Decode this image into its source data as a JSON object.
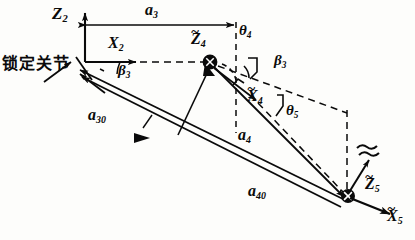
{
  "figure": {
    "type": "kinematic-linkage-diagram",
    "caption_text": "锁定关节",
    "background_color": "#fdfdfb",
    "ink_color": "#0a0a0a"
  },
  "annotations": {
    "locked_joint_label": "锁定关节",
    "z2": "Z",
    "z2_sub": "2",
    "x2": "X",
    "x2_sub": "2",
    "a3": "a",
    "a3_sub": "3",
    "z4t": "Z",
    "z4t_sub": "4",
    "theta4": "θ",
    "theta4_sub": "4",
    "beta3_left": "β",
    "beta3_left_sub": "3",
    "beta3_right": "β",
    "beta3_right_sub": "3",
    "x4t": "X",
    "x4t_sub": "4",
    "theta5": "θ",
    "theta5_sub": "5",
    "a30": "a",
    "a30_sub": "30",
    "a4": "a",
    "a4_sub": "4",
    "a40": "a",
    "a40_sub": "40",
    "z5t": "Z",
    "z5t_sub": "5",
    "x5t": "X",
    "x5t_sub": "5",
    "tilde_mark": "~"
  },
  "geometry": {
    "origin": {
      "x": 85,
      "y": 62
    },
    "joint4": {
      "x": 210,
      "y": 62
    },
    "joint5": {
      "x": 348,
      "y": 196
    },
    "a3_dim_line": {
      "x1": 86,
      "y1": 25,
      "x2": 234,
      "y2": 25
    },
    "vertical_ref_line": {
      "x": 236,
      "y1": 24,
      "y2": 132
    },
    "z2_axis_tip": {
      "x": 85,
      "y": 12
    },
    "x2_axis_tip": {
      "x": 140,
      "y": 62
    },
    "x5_axis_tip": {
      "x": 392,
      "y": 214
    },
    "z5_axis_tip": {
      "x": 368,
      "y": 158
    }
  }
}
